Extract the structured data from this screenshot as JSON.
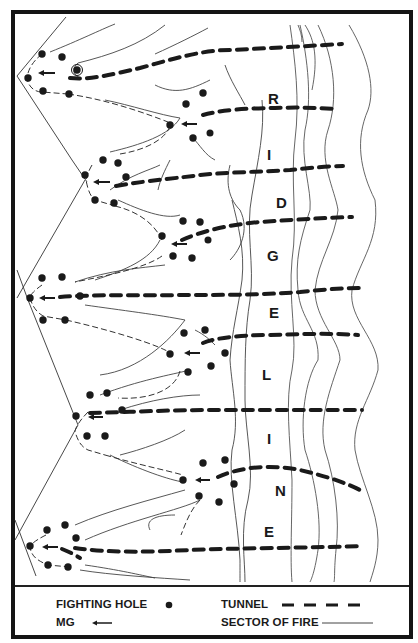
{
  "diagram": {
    "type": "tactical terrain sketch",
    "ridge_label_letters": [
      "R",
      "I",
      "D",
      "G",
      "E",
      "L",
      "I",
      "N",
      "E"
    ],
    "ridge_label": "RIDGELINE"
  },
  "legend": {
    "fighting_hole_label": "FIGHTING HOLE",
    "mg_label": "MG",
    "tunnel_label": "TUNNEL",
    "sector_of_fire_label": "SECTOR OF FIRE"
  },
  "colors": {
    "ink": "#1a1a1a",
    "paper": "#ffffff",
    "contour": "#444444"
  }
}
